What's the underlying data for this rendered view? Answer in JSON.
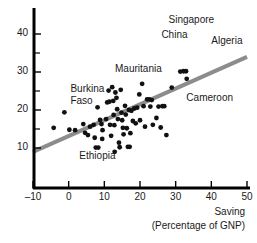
{
  "chart_data": {
    "type": "scatter",
    "title": "",
    "xlabel": "Saving (Percentage of GNP)",
    "xlabel_line1": "Saving",
    "xlabel_line2": "(Percentage of GNP)",
    "ylabel": "",
    "xlim": [
      -10,
      50
    ],
    "ylim": [
      5,
      44
    ],
    "grid": false,
    "legend": null,
    "xticks": [
      -10,
      0,
      10,
      20,
      30,
      40,
      50
    ],
    "xtick_labels": [
      "–10",
      "0",
      "10",
      "20",
      "30",
      "40",
      "50"
    ],
    "yticks": [
      10,
      20,
      30,
      40
    ],
    "ytick_labels": [
      "10",
      "20",
      "30",
      "40"
    ],
    "y_minor_ticks": [
      15,
      25,
      35
    ],
    "point_color": "#111111",
    "line_color": "#8c8c8c",
    "axis_color": "#000000",
    "trendline": {
      "x": [
        -10,
        50
      ],
      "y": [
        9.0,
        34.0
      ],
      "label": "regression line"
    },
    "annotations": [
      {
        "text": "Singapore",
        "x": 28.0,
        "y": 43.5
      },
      {
        "text": "China",
        "x": 26.0,
        "y": 39.5
      },
      {
        "text": "Algeria",
        "x": 40.0,
        "y": 38.0
      },
      {
        "text": "Mauritania",
        "x": 13.0,
        "y": 30.5
      },
      {
        "text": "Burkina",
        "x": 0.5,
        "y": 25.2
      },
      {
        "text": "Faso",
        "x": 0.5,
        "y": 22.2
      },
      {
        "text": "Cameroon",
        "x": 33.0,
        "y": 23.0
      },
      {
        "text": "Ethiopia",
        "x": 3.0,
        "y": 7.6
      }
    ],
    "points": [
      {
        "x": -4.2,
        "y": 15.3
      },
      {
        "x": -1.2,
        "y": 19.4
      },
      {
        "x": 0.2,
        "y": 14.8
      },
      {
        "x": 1.8,
        "y": 14.7
      },
      {
        "x": 4.1,
        "y": 16.3
      },
      {
        "x": 4.6,
        "y": 14.0
      },
      {
        "x": 5.4,
        "y": 13.4
      },
      {
        "x": 6.0,
        "y": 15.6
      },
      {
        "x": 7.0,
        "y": 16.1
      },
      {
        "x": 7.3,
        "y": 12.7
      },
      {
        "x": 7.6,
        "y": 10.1
      },
      {
        "x": 8.3,
        "y": 10.1
      },
      {
        "x": 8.1,
        "y": 20.7
      },
      {
        "x": 8.8,
        "y": 17.4
      },
      {
        "x": 9.2,
        "y": 16.3
      },
      {
        "x": 9.5,
        "y": 14.7
      },
      {
        "x": 9.4,
        "y": 12.4
      },
      {
        "x": 10.5,
        "y": 17.6
      },
      {
        "x": 10.8,
        "y": 22.0
      },
      {
        "x": 11.2,
        "y": 25.1
      },
      {
        "x": 11.4,
        "y": 22.2
      },
      {
        "x": 11.6,
        "y": 16.1
      },
      {
        "x": 11.9,
        "y": 13.2
      },
      {
        "x": 12.2,
        "y": 26.0
      },
      {
        "x": 12.5,
        "y": 22.4
      },
      {
        "x": 12.6,
        "y": 18.7
      },
      {
        "x": 12.8,
        "y": 16.0
      },
      {
        "x": 12.9,
        "y": 9.0
      },
      {
        "x": 13.1,
        "y": 24.6
      },
      {
        "x": 13.4,
        "y": 23.2
      },
      {
        "x": 13.6,
        "y": 20.2
      },
      {
        "x": 13.8,
        "y": 17.6
      },
      {
        "x": 14.1,
        "y": 11.4
      },
      {
        "x": 14.3,
        "y": 10.2
      },
      {
        "x": 14.6,
        "y": 25.3
      },
      {
        "x": 14.8,
        "y": 19.3
      },
      {
        "x": 15.0,
        "y": 17.3
      },
      {
        "x": 15.2,
        "y": 15.3
      },
      {
        "x": 15.4,
        "y": 13.6
      },
      {
        "x": 15.8,
        "y": 21.1
      },
      {
        "x": 16.0,
        "y": 18.8
      },
      {
        "x": 16.3,
        "y": 15.2
      },
      {
        "x": 16.6,
        "y": 10.3
      },
      {
        "x": 17.1,
        "y": 10.3
      },
      {
        "x": 16.9,
        "y": 20.0
      },
      {
        "x": 17.3,
        "y": 13.9
      },
      {
        "x": 17.6,
        "y": 19.8
      },
      {
        "x": 18.0,
        "y": 17.1
      },
      {
        "x": 18.4,
        "y": 20.4
      },
      {
        "x": 18.8,
        "y": 16.5
      },
      {
        "x": 19.2,
        "y": 20.6
      },
      {
        "x": 19.8,
        "y": 24.1
      },
      {
        "x": 20.0,
        "y": 17.3
      },
      {
        "x": 20.6,
        "y": 26.9
      },
      {
        "x": 21.0,
        "y": 21.0
      },
      {
        "x": 21.4,
        "y": 15.6
      },
      {
        "x": 22.0,
        "y": 22.8
      },
      {
        "x": 22.6,
        "y": 22.8
      },
      {
        "x": 22.9,
        "y": 20.9
      },
      {
        "x": 23.3,
        "y": 22.6
      },
      {
        "x": 23.6,
        "y": 16.1
      },
      {
        "x": 24.6,
        "y": 17.9
      },
      {
        "x": 25.2,
        "y": 20.9
      },
      {
        "x": 25.8,
        "y": 15.4
      },
      {
        "x": 26.3,
        "y": 21.0
      },
      {
        "x": 26.8,
        "y": 21.0
      },
      {
        "x": 27.4,
        "y": 13.4
      },
      {
        "x": 28.9,
        "y": 25.9
      },
      {
        "x": 31.3,
        "y": 30.1
      },
      {
        "x": 32.2,
        "y": 30.2
      },
      {
        "x": 32.9,
        "y": 30.2
      },
      {
        "x": 33.1,
        "y": 28.2
      }
    ]
  }
}
